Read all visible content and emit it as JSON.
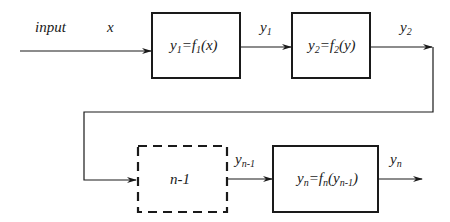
{
  "diagram": {
    "input_label": "input",
    "x_label": "x",
    "blocks": [
      {
        "id": "block-1",
        "main": "y",
        "sub1": "1",
        "eq": "=f",
        "sub2": "1",
        "arg": "(x)"
      },
      {
        "id": "block-2",
        "main": "y",
        "sub1": "2",
        "eq": "=f",
        "sub2": "2",
        "arg": "(y)"
      },
      {
        "id": "block-n-1",
        "label": "n-1",
        "dashed": true
      },
      {
        "id": "block-n",
        "main": "y",
        "sub1": "n",
        "eq": "=f",
        "sub2": "n",
        "arg_open": "(y",
        "arg_sub": "n-1",
        "arg_close": ")"
      }
    ],
    "signals": [
      {
        "main": "y",
        "sub": "1"
      },
      {
        "main": "y",
        "sub": "2"
      },
      {
        "main": "y",
        "sub": "n-1"
      },
      {
        "main": "y",
        "sub": "n"
      }
    ],
    "colors": {
      "stroke": "#1a1a1a",
      "background": "#ffffff"
    }
  }
}
